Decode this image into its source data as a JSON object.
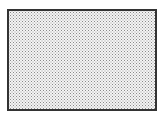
{
  "figure": {
    "border_color": "#333333",
    "fill_color": "#f4f4f4",
    "dot_color": "#8a8a8a"
  }
}
